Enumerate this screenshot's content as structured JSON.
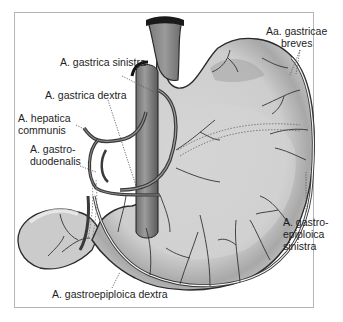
{
  "figure": {
    "colors": {
      "stomach_fill": "#cfcfcf",
      "stomach_shade": "#a9a9a9",
      "artery": "#3a3a3a",
      "outline": "#2a2a2a",
      "frame": "#b5b5b5"
    }
  },
  "labels": {
    "gastrica_sinistra": "A. gastrica sinistra",
    "gastrica_dextra": "A. gastrica dextra",
    "hepatica_communis_1": "A. hepatica",
    "hepatica_communis_2": "communis",
    "gastroduodenalis_1": "A. gastro-",
    "gastroduodenalis_2": "duodenalis",
    "gastricae_breves_1": "Aa. gastricae",
    "gastricae_breves_2": "breves",
    "gastroepiploica_sinistra_1": "A. gastro-",
    "gastroepiploica_sinistra_2": "epiploica",
    "gastroepiploica_sinistra_3": "sinistra",
    "gastroepiploica_dextra": "A. gastroepiploica dextra"
  }
}
